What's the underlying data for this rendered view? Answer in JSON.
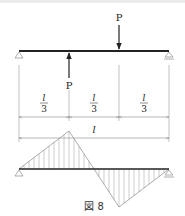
{
  "figure": {
    "caption": "図 8",
    "beam": {
      "span_label": "l",
      "supports": [
        "pin-left",
        "roller-right"
      ]
    },
    "loads": [
      {
        "label": "P",
        "direction": "up",
        "position": "l/3 from left"
      },
      {
        "label": "P",
        "direction": "down",
        "position": "2l/3 from left"
      }
    ],
    "dimensions": {
      "segments": [
        {
          "num": "l",
          "den": "3"
        },
        {
          "num": "l",
          "den": "3"
        },
        {
          "num": "l",
          "den": "3"
        }
      ],
      "total": "l"
    },
    "moment_diagram": {
      "description": "Antisymmetric bending moment diagram: triangular peak above beam at l/3, crossing zero at midspan, triangular trough below beam at 2l/3",
      "hatching": "vertical"
    }
  },
  "colors": {
    "line": "#222222",
    "thin_line": "#888888",
    "hatch": "#999999"
  }
}
